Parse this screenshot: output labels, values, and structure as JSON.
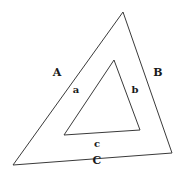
{
  "figure": {
    "background_color": "#ffffff",
    "stroke_color": "#3a3a3a",
    "text_color": "#1a1a1a",
    "stroke_width": 1
  },
  "outer_triangle": {
    "name": "outer-triangle",
    "vertices": [
      {
        "x": 123,
        "y": 12
      },
      {
        "x": 172,
        "y": 153
      },
      {
        "x": 13,
        "y": 165
      }
    ],
    "labels": {
      "left": "A",
      "right": "B",
      "bottom": "C"
    },
    "label_positions": {
      "left": {
        "x": 57,
        "y": 72
      },
      "right": {
        "x": 158,
        "y": 72
      },
      "bottom": {
        "x": 97,
        "y": 160
      }
    }
  },
  "inner_triangle": {
    "name": "inner-triangle",
    "vertices": [
      {
        "x": 114,
        "y": 60
      },
      {
        "x": 140,
        "y": 130
      },
      {
        "x": 64,
        "y": 135
      }
    ],
    "labels": {
      "left": "a",
      "right": "b",
      "bottom": "c"
    },
    "label_positions": {
      "left": {
        "x": 76,
        "y": 90
      },
      "right": {
        "x": 135,
        "y": 90
      },
      "bottom": {
        "x": 97,
        "y": 144
      }
    }
  }
}
